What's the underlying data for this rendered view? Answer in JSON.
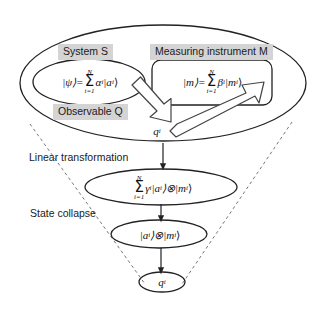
{
  "diagram": {
    "background_color": "#ffffff",
    "line_color": "#222222",
    "label_shade_color": "#d4d4d4",
    "outer_region": {
      "name": "outer-ellipse"
    },
    "labels": {
      "system": "System S",
      "instrument": "Measuring instrument M",
      "observable": "Observable Q",
      "linear_transformation": "Linear transformation",
      "state_collapse": "State collapse"
    },
    "formulas": {
      "system_state_lhs": "|ψ⟩=",
      "system_state_sum_top": "N",
      "system_state_sum_bottom": "i=1",
      "system_state_rhs": "α",
      "system_state_rhs_sub": "i",
      "system_state_ket": "|a",
      "system_state_ket_sub": "i",
      "system_state_ket_close": "⟩",
      "instrument_state_lhs": "|m⟩=",
      "instrument_state_sum_top": "N",
      "instrument_state_sum_bottom": "i=1",
      "instrument_state_rhs": "β",
      "instrument_state_rhs_sub": "i",
      "instrument_state_ket": "|m",
      "instrument_state_ket_sub": "i",
      "instrument_state_ket_close": "⟩",
      "entangled_sum_top": "N",
      "entangled_sum_bottom": "i=1",
      "entangled_coeff": "γ",
      "entangled_coeff_sub": "i",
      "entangled_ket_a": "|a",
      "entangled_ket_a_sub": "i",
      "entangled_tensor": "⟩⊗|m",
      "entangled_ket_m_sub": "i",
      "entangled_close": "⟩",
      "collapsed_ket_a": "|a",
      "collapsed_ket_a_sub": "i",
      "collapsed_tensor": "⟩⊗|m",
      "collapsed_ket_m_sub": "i",
      "collapsed_close": "⟩",
      "eigenvalue": "q",
      "eigenvalue_sub": "i",
      "eigenvalue_bottom": "q",
      "eigenvalue_bottom_sub": "i"
    },
    "arrows": {
      "observable_to_outcome": "block-arrow-down-right",
      "outcome_to_instrument": "block-arrow-up-right",
      "linear_transformation_arrow": "arrow-down",
      "state_collapse_arrow": "arrow-down",
      "readout_arrow": "arrow-down"
    }
  }
}
